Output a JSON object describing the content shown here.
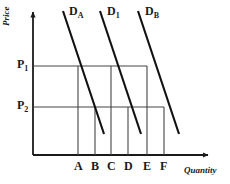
{
  "figure": {
    "axes": {
      "y_title": "Price",
      "x_title": "Quantity",
      "origin_x": 33,
      "origin_y": 155,
      "x_end": 208,
      "y_end": 12
    },
    "price_ticks": [
      {
        "name": "p1",
        "base": "P",
        "sub": "1",
        "y": 66
      },
      {
        "name": "p2",
        "base": "P",
        "sub": "2",
        "y": 107
      }
    ],
    "quantity_ticks": [
      {
        "label": "A",
        "x": 78
      },
      {
        "label": "B",
        "x": 95
      },
      {
        "label": "C",
        "x": 111
      },
      {
        "label": "D",
        "x": 128
      },
      {
        "label": "E",
        "x": 147
      },
      {
        "label": "F",
        "x": 164
      }
    ],
    "curves": [
      {
        "name": "D_A",
        "base": "D",
        "sub": "A",
        "x1": 63,
        "y1": 11,
        "x2": 104,
        "y2": 134
      },
      {
        "name": "D_1",
        "base": "D",
        "sub": "1",
        "x1": 100,
        "y1": 11,
        "x2": 141,
        "y2": 134
      },
      {
        "name": "D_B",
        "base": "D",
        "sub": "B",
        "x1": 138,
        "y1": 11,
        "x2": 179,
        "y2": 134
      }
    ],
    "price_lines": [
      {
        "name": "p1-line",
        "y": 66,
        "x_start": 33,
        "x_end": 147
      },
      {
        "name": "p2-line",
        "y": 107,
        "x_start": 33,
        "x_end": 164
      }
    ],
    "drop_lines": [
      {
        "name": "drop-a",
        "x": 78,
        "y_top": 66
      },
      {
        "name": "drop-b",
        "x": 95,
        "y_top": 107
      },
      {
        "name": "drop-c",
        "x": 111,
        "y_top": 66
      },
      {
        "name": "drop-d",
        "x": 128,
        "y_top": 107
      },
      {
        "name": "drop-e",
        "x": 147,
        "y_top": 66
      },
      {
        "name": "drop-f",
        "x": 164,
        "y_top": 107
      }
    ],
    "colors": {
      "ink": "#1a1a1a",
      "curve": "#111111",
      "grid": "#444444",
      "background": "#ffffff"
    }
  },
  "chart_data": {
    "type": "line",
    "title": "",
    "xlabel": "Quantity",
    "ylabel": "Price",
    "grid": false,
    "legend": "inline-curve-labels",
    "xticklabels": [
      "A",
      "B",
      "C",
      "D",
      "E",
      "F"
    ],
    "yticklabels": [
      "P1",
      "P2"
    ],
    "series": [
      {
        "name": "D_A",
        "note": "Demand curve A (leftmost), downward sloping",
        "points": [
          {
            "quantity_label": "A",
            "price_label": "P1"
          },
          {
            "quantity_label": "B",
            "price_label": "P2"
          }
        ]
      },
      {
        "name": "D_1",
        "note": "Demand curve 1 (middle), downward sloping, parallel to D_A",
        "points": [
          {
            "quantity_label": "C",
            "price_label": "P1"
          },
          {
            "quantity_label": "D",
            "price_label": "P2"
          }
        ]
      },
      {
        "name": "D_B",
        "note": "Demand curve B (rightmost), downward sloping, parallel to D_A",
        "points": [
          {
            "quantity_label": "E",
            "price_label": "P1"
          },
          {
            "quantity_label": "F",
            "price_label": "P2"
          }
        ]
      }
    ],
    "annotations": [
      "Horizontal line at P1 meets D_A at A, D_1 at C, D_B at E",
      "Horizontal line at P2 meets D_A at B, D_1 at D, D_B at F"
    ]
  }
}
